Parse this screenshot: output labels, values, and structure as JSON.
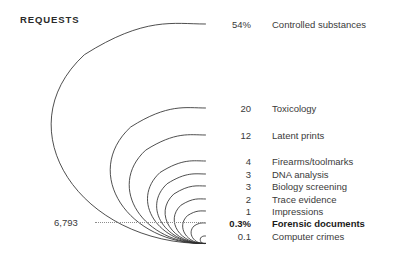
{
  "chart_title": "REQUESTS",
  "total": {
    "value": "6,793",
    "leader": "leader-line"
  },
  "chart_data": {
    "type": "bar",
    "variant": "nested-arc-teardrop",
    "title": "REQUESTS",
    "xlabel": "",
    "ylabel": "",
    "categories": [
      "Controlled substances",
      "Toxicology",
      "Latent prints",
      "Firearms/toolmarks",
      "DNA analysis",
      "Biology screening",
      "Trace evidence",
      "Impressions",
      "Forensic documents",
      "Computer crimes"
    ],
    "values": [
      54,
      20,
      12,
      4,
      3,
      3,
      2,
      1,
      0.3,
      0.1
    ],
    "value_labels": [
      "54%",
      "20",
      "12",
      "4",
      "3",
      "3",
      "2",
      "1",
      "0.3%",
      "0.1"
    ],
    "unit": "percent",
    "total_label": "6,793",
    "highlighted": "Forensic documents",
    "ylim": [
      0,
      54
    ],
    "grid": false,
    "legend": null,
    "rows": [
      {
        "value": "54%",
        "label": "Controlled substances",
        "magnitude": 54,
        "top": 18,
        "highlight": false
      },
      {
        "value": "20",
        "label": "Toxicology",
        "magnitude": 20,
        "top": 102,
        "highlight": false
      },
      {
        "value": "12",
        "label": "Latent prints",
        "magnitude": 12,
        "top": 129,
        "highlight": false
      },
      {
        "value": "4",
        "label": "Firearms/toolmarks",
        "magnitude": 4,
        "top": 155,
        "highlight": false
      },
      {
        "value": "3",
        "label": "DNA analysis",
        "magnitude": 3,
        "top": 168,
        "highlight": false
      },
      {
        "value": "3",
        "label": "Biology screening",
        "magnitude": 3,
        "top": 180,
        "highlight": false
      },
      {
        "value": "2",
        "label": "Trace evidence",
        "magnitude": 2,
        "top": 193,
        "highlight": false
      },
      {
        "value": "1",
        "label": "Impressions",
        "magnitude": 1,
        "top": 205,
        "highlight": false
      },
      {
        "value": "0.3%",
        "label": "Forensic documents",
        "magnitude": 0.3,
        "top": 217,
        "highlight": true
      },
      {
        "value": "0.1",
        "label": "Computer crimes",
        "magnitude": 0.1,
        "top": 230,
        "highlight": false
      }
    ]
  },
  "colors": {
    "stroke": "#2f2f2f",
    "text": "#3a3a3a",
    "emphasis": "#1a1a1a",
    "leader": "#8d8d8d",
    "background": "#ffffff"
  }
}
